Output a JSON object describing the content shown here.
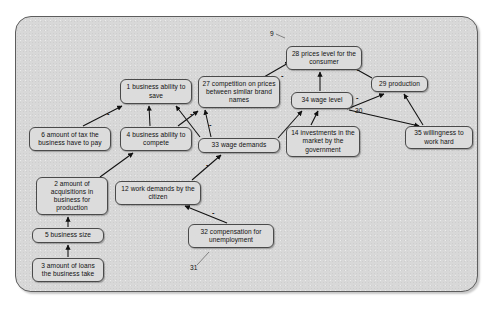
{
  "diagram": {
    "frame": {
      "fill": "#d8d8d8",
      "stroke": "#5d5d5d"
    },
    "node_style": {
      "fill": "#dcdcdc",
      "stroke": "#4a4a4a",
      "text": "#111111"
    },
    "nodes": [
      {
        "id": "n1",
        "label": "1 business ability to save",
        "x": 120,
        "y": 79,
        "w": 72,
        "h": 25
      },
      {
        "id": "n27",
        "label": "27 competition on prices between similar brand names",
        "x": 198,
        "y": 76,
        "w": 82,
        "h": 32
      },
      {
        "id": "n28",
        "label": "28 prices level for the consumer",
        "x": 286,
        "y": 46,
        "w": 76,
        "h": 24
      },
      {
        "id": "n29",
        "label": "29 production",
        "x": 371,
        "y": 76,
        "w": 57,
        "h": 16
      },
      {
        "id": "n34",
        "label": "34 wage level",
        "x": 291,
        "y": 92,
        "w": 62,
        "h": 17
      },
      {
        "id": "n6",
        "label": "6 amount of tax the business have to pay",
        "x": 29,
        "y": 127,
        "w": 82,
        "h": 24
      },
      {
        "id": "n4",
        "label": "4 business ability to compete",
        "x": 120,
        "y": 127,
        "w": 72,
        "h": 24
      },
      {
        "id": "n33",
        "label": "33 wage demands",
        "x": 198,
        "y": 138,
        "w": 82,
        "h": 15
      },
      {
        "id": "n14",
        "label": "14 investments in the market by the government",
        "x": 286,
        "y": 126,
        "w": 74,
        "h": 31
      },
      {
        "id": "n35",
        "label": "35 willingness to work hard",
        "x": 405,
        "y": 126,
        "w": 68,
        "h": 23
      },
      {
        "id": "n2",
        "label": "2 amount of acquisitions in business for production",
        "x": 36,
        "y": 177,
        "w": 72,
        "h": 38
      },
      {
        "id": "n12",
        "label": "12 work demands by the citizen",
        "x": 115,
        "y": 181,
        "w": 86,
        "h": 24
      },
      {
        "id": "n5",
        "label": "5 business size",
        "x": 32,
        "y": 228,
        "w": 72,
        "h": 15
      },
      {
        "id": "n32",
        "label": "32 compensation for unemployment",
        "x": 188,
        "y": 224,
        "w": 86,
        "h": 24
      },
      {
        "id": "n3",
        "label": "3 amount of loans the business take",
        "x": 32,
        "y": 258,
        "w": 72,
        "h": 24
      }
    ],
    "edge_labels": [
      {
        "id": "lbl9",
        "text": "9",
        "x": 270,
        "y": 31
      },
      {
        "id": "lbl30",
        "text": "30",
        "x": 366,
        "y": 110
      },
      {
        "id": "lbl31",
        "text": "31",
        "x": 192,
        "y": 267
      }
    ],
    "sign_labels": [
      {
        "id": "s-6-1",
        "text": "-",
        "x": 109,
        "y": 113
      },
      {
        "id": "s-4-27",
        "text": "-",
        "x": 191,
        "y": 113
      },
      {
        "id": "s-33-27",
        "text": "-",
        "x": 208,
        "y": 123
      },
      {
        "id": "s-12-33",
        "text": "-",
        "x": 206,
        "y": 163
      },
      {
        "id": "s-32-12",
        "text": "-",
        "x": 211,
        "y": 211
      },
      {
        "id": "s-27-28",
        "text": "-",
        "x": 283,
        "y": 75
      },
      {
        "id": "s-29-28",
        "text": "-",
        "x": 357,
        "y": 69
      },
      {
        "id": "s-34-29",
        "text": "-",
        "x": 355,
        "y": 97
      }
    ],
    "edges": [
      {
        "from": "n6",
        "to": "n1",
        "points": "54,126 84,104",
        "sign": "-"
      },
      {
        "from": "n4",
        "to": "n1",
        "points": "150,126 148,105",
        "sign": ""
      },
      {
        "from": "n33",
        "to": "n1",
        "points": "200,137 162,105",
        "sign": ""
      },
      {
        "from": "n4",
        "to": "n27",
        "points": "174,126 198,110",
        "sign": "-"
      },
      {
        "from": "n33",
        "to": "n27",
        "points": "214,137 218,110",
        "sign": "-"
      },
      {
        "from": "n2",
        "to": "n4",
        "points": "96,176 132,152",
        "sign": ""
      },
      {
        "from": "n5",
        "to": "n2",
        "points": "68,227 68,216",
        "sign": ""
      },
      {
        "from": "n3",
        "to": "n5",
        "points": "68,257 68,244",
        "sign": ""
      },
      {
        "from": "n12",
        "to": "n33",
        "points": "192,180 218,155",
        "sign": "-"
      },
      {
        "from": "n32",
        "to": "n12",
        "points": "224,223 186,206",
        "sign": "-"
      },
      {
        "from": "n27",
        "to": "n28",
        "points": "266,75 290,62",
        "sign": "-"
      },
      {
        "from": "n34",
        "to": "n28",
        "points": "320,91 320,72",
        "sign": ""
      },
      {
        "from": "n29",
        "to": "n28",
        "points": "370,76 348,63",
        "sign": "-"
      },
      {
        "from": "n33",
        "to": "n34",
        "points": "278,137 300,111",
        "sign": ""
      },
      {
        "from": "n14",
        "to": "n34",
        "points": "312,125 318,110",
        "sign": ""
      },
      {
        "from": "n34",
        "to": "n29",
        "points": "346,108 382,94",
        "sign": ""
      },
      {
        "from": "n35",
        "to": "n29",
        "points": "420,125 404,94",
        "sign": ""
      },
      {
        "from": "n34",
        "to": "n35",
        "points": "348,108 418,124",
        "sign": ""
      }
    ]
  }
}
